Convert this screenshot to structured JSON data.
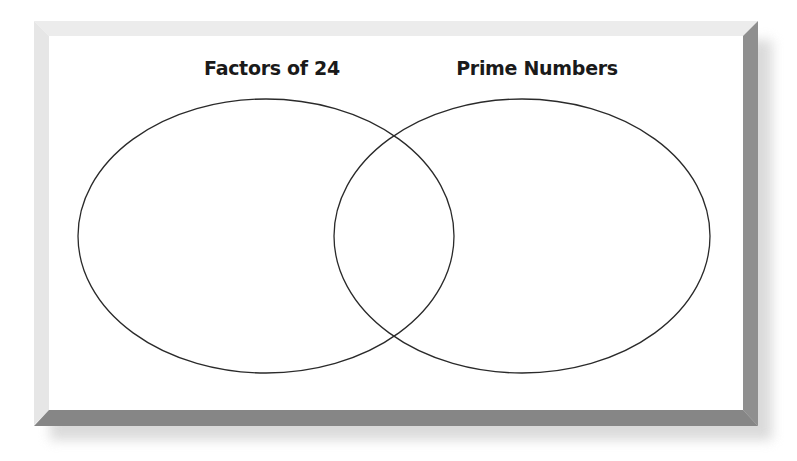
{
  "diagram": {
    "type": "venn",
    "sets": [
      {
        "label": "Factors of 24",
        "members": [],
        "ellipse": {
          "cx": 266,
          "cy": 236,
          "rx": 188,
          "ry": 137
        }
      },
      {
        "label": "Prime Numbers",
        "members": [],
        "ellipse": {
          "cx": 522,
          "cy": 236,
          "rx": 188,
          "ry": 137
        }
      }
    ],
    "intersection_members": [],
    "colors": {
      "panel": "#ffffff",
      "bevel_light": "#ebebeb",
      "bevel_dark": "#8c8c8c",
      "outline": "#2a2a2a",
      "text": "#1a1a1a"
    }
  }
}
